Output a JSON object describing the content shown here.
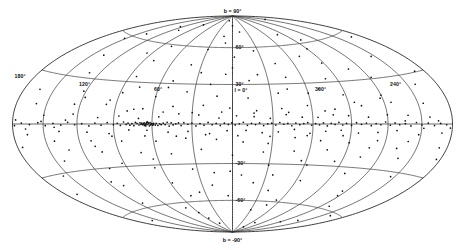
{
  "figure": {
    "name": "galactic-sky-map",
    "projection": "Hammer-Aitoff",
    "coordinate_system": "galactic",
    "background_color": "#ffffff",
    "line_color": "#3a3a3a",
    "point_color": "#111111"
  },
  "labels": {
    "north_pole": "b = 90°",
    "south_pole": "b = -90°",
    "center_longitude": "l = 0°",
    "longitude_ticks": [
      {
        "text": "180°",
        "lon": 180
      },
      {
        "text": "120°",
        "lon": 120
      },
      {
        "text": "60°",
        "lon": 60
      },
      {
        "text": "300°",
        "lon": -60
      },
      {
        "text": "240°",
        "lon": -120
      }
    ],
    "latitude_ticks": [
      {
        "text": "60°",
        "lat": 60
      },
      {
        "text": "30°",
        "lat": 30
      },
      {
        "text": "-30°",
        "lat": -30
      },
      {
        "text": "-60°",
        "lat": -60
      }
    ]
  },
  "chart_data": {
    "type": "scatter",
    "title": "",
    "xlabel": "Galactic longitude l",
    "ylabel": "Galactic latitude b",
    "projection": "Hammer-Aitoff equal-area",
    "grid": true,
    "legend": null,
    "xlim": [
      180,
      -180
    ],
    "ylim": [
      -90,
      90
    ],
    "graticule": {
      "longitude_lines": [
        180,
        150,
        120,
        90,
        60,
        30,
        0,
        -30,
        -60,
        -90,
        -120,
        -150,
        -180
      ],
      "latitude_lines": [
        60,
        30,
        0,
        -30,
        -60
      ],
      "labeled_longitudes": [
        180,
        120,
        60,
        0,
        -60,
        -120
      ],
      "labeled_latitudes": [
        90,
        60,
        30,
        -30,
        -60,
        -90
      ]
    },
    "point_count": 312,
    "point_radius_px": 0.85,
    "points": [
      [
        62.5,
        0.2
      ],
      [
        63.8,
        -0.4
      ],
      [
        64.5,
        0.5
      ],
      [
        65.2,
        -0.2
      ],
      [
        66.0,
        0.8
      ],
      [
        61.0,
        -0.6
      ],
      [
        60.2,
        0.3
      ],
      [
        59.5,
        -0.9
      ],
      [
        64.0,
        1.2
      ],
      [
        65.8,
        -1.0
      ],
      [
        63.0,
        0.9
      ],
      [
        62.0,
        -1.3
      ],
      [
        66.5,
        0.1
      ],
      [
        67.2,
        -0.5
      ],
      [
        61.5,
        1.0
      ],
      [
        58.8,
        0.4
      ],
      [
        60.8,
        -0.1
      ],
      [
        64.8,
        -1.4
      ],
      [
        63.5,
        1.5
      ],
      [
        59.0,
        -0.3
      ],
      [
        67.8,
        0.6
      ],
      [
        57.5,
        -0.8
      ],
      [
        68.5,
        -0.2
      ],
      [
        56.8,
        0.5
      ],
      [
        69.2,
        0.9
      ],
      [
        55.5,
        -1.1
      ],
      [
        70.0,
        -0.7
      ],
      [
        54.2,
        0.2
      ],
      [
        71.5,
        0.4
      ],
      [
        53.0,
        -0.5
      ],
      [
        72.8,
        1.1
      ],
      [
        51.5,
        0.7
      ],
      [
        74.0,
        -1.2
      ],
      [
        50.0,
        -0.4
      ],
      [
        75.5,
        0.3
      ],
      [
        48.5,
        1.3
      ],
      [
        77.0,
        -0.8
      ],
      [
        47.0,
        -1.5
      ],
      [
        78.5,
        0.6
      ],
      [
        45.5,
        0.9
      ],
      [
        80.0,
        -0.3
      ],
      [
        44.0,
        -0.7
      ],
      [
        82.0,
        1.4
      ],
      [
        42.0,
        0.1
      ],
      [
        84.5,
        -1.0
      ],
      [
        40.0,
        0.8
      ],
      [
        87.0,
        0.5
      ],
      [
        38.0,
        -1.2
      ],
      [
        90.0,
        -0.6
      ],
      [
        36.0,
        1.0
      ],
      [
        33.0,
        -0.2
      ],
      [
        30.0,
        0.7
      ],
      [
        27.0,
        -1.4
      ],
      [
        24.0,
        0.3
      ],
      [
        21.0,
        -0.9
      ],
      [
        18.0,
        1.2
      ],
      [
        15.0,
        -0.5
      ],
      [
        12.0,
        0.4
      ],
      [
        9.0,
        -1.1
      ],
      [
        6.0,
        0.6
      ],
      [
        3.0,
        -0.3
      ],
      [
        0.5,
        0.9
      ],
      [
        -2.0,
        -0.7
      ],
      [
        -5.0,
        0.2
      ],
      [
        -8.0,
        1.3
      ],
      [
        -11.0,
        -1.0
      ],
      [
        -14.0,
        0.5
      ],
      [
        -17.0,
        -0.4
      ],
      [
        -20.0,
        0.8
      ],
      [
        -23.0,
        -1.2
      ],
      [
        -26.0,
        0.1
      ],
      [
        -29.0,
        0.6
      ],
      [
        -32.0,
        -0.8
      ],
      [
        -35.0,
        1.1
      ],
      [
        -38.0,
        -0.2
      ],
      [
        -41.0,
        0.4
      ],
      [
        -44.0,
        -1.3
      ],
      [
        -47.0,
        0.7
      ],
      [
        -50.0,
        -0.5
      ],
      [
        -53.0,
        0.3
      ],
      [
        -56.0,
        1.0
      ],
      [
        -59.0,
        -0.9
      ],
      [
        -62.0,
        0.2
      ],
      [
        -65.0,
        -0.6
      ],
      [
        -68.0,
        0.8
      ],
      [
        -71.0,
        -1.4
      ],
      [
        -74.0,
        0.5
      ],
      [
        -77.0,
        -0.3
      ],
      [
        -80.0,
        1.2
      ],
      [
        -83.0,
        -0.7
      ],
      [
        -86.0,
        0.4
      ],
      [
        -90.0,
        -1.0
      ],
      [
        -94.0,
        0.9
      ],
      [
        -98.0,
        -0.2
      ],
      [
        -102.0,
        0.6
      ],
      [
        -106.0,
        -1.1
      ],
      [
        -110.0,
        0.3
      ],
      [
        -114.0,
        -0.5
      ],
      [
        -118.0,
        1.3
      ],
      [
        -122.0,
        -0.8
      ],
      [
        -126.0,
        0.7
      ],
      [
        -130.0,
        -0.4
      ],
      [
        -135.0,
        0.2
      ],
      [
        -140.0,
        -1.2
      ],
      [
        -145.0,
        0.9
      ],
      [
        -150.0,
        -0.6
      ],
      [
        -156.0,
        0.5
      ],
      [
        -162.0,
        -0.9
      ],
      [
        -168.0,
        0.3
      ],
      [
        -174.0,
        -0.4
      ],
      [
        95.0,
        1.0
      ],
      [
        100.0,
        -0.8
      ],
      [
        105.0,
        0.6
      ],
      [
        110.0,
        -1.3
      ],
      [
        116.0,
        0.2
      ],
      [
        122.0,
        -0.5
      ],
      [
        128.0,
        1.1
      ],
      [
        134.0,
        -0.7
      ],
      [
        141.0,
        0.4
      ],
      [
        148.0,
        -1.0
      ],
      [
        155.0,
        0.8
      ],
      [
        163.0,
        -0.3
      ],
      [
        171.0,
        0.5
      ],
      [
        178.0,
        -0.9
      ],
      [
        70.5,
        4.0
      ],
      [
        64.0,
        -4.5
      ],
      [
        55.0,
        5.2
      ],
      [
        48.0,
        -6.0
      ],
      [
        40.0,
        7.5
      ],
      [
        33.0,
        -5.5
      ],
      [
        25.0,
        6.8
      ],
      [
        17.0,
        -7.2
      ],
      [
        10.0,
        4.5
      ],
      [
        4.0,
        -5.0
      ],
      [
        -3.0,
        6.2
      ],
      [
        -10.0,
        -4.8
      ],
      [
        -16.0,
        5.5
      ],
      [
        -22.0,
        -6.5
      ],
      [
        -28.0,
        4.2
      ],
      [
        -34.0,
        -5.8
      ],
      [
        -40.0,
        7.0
      ],
      [
        -46.0,
        -4.0
      ],
      [
        -52.0,
        5.0
      ],
      [
        -58.0,
        -6.8
      ],
      [
        -64.0,
        4.8
      ],
      [
        -70.0,
        -5.2
      ],
      [
        -76.0,
        6.5
      ],
      [
        -82.0,
        -4.4
      ],
      [
        -88.0,
        5.8
      ],
      [
        -96.0,
        -6.2
      ],
      [
        -104.0,
        4.6
      ],
      [
        -112.0,
        -5.6
      ],
      [
        -120.0,
        6.0
      ],
      [
        -128.0,
        -4.2
      ],
      [
        -138.0,
        5.4
      ],
      [
        -148.0,
        -6.4
      ],
      [
        -158.0,
        4.0
      ],
      [
        -170.0,
        -5.0
      ],
      [
        78.0,
        -4.2
      ],
      [
        86.0,
        5.6
      ],
      [
        94.0,
        -6.6
      ],
      [
        103.0,
        4.4
      ],
      [
        112.0,
        -5.4
      ],
      [
        124.0,
        6.4
      ],
      [
        136.0,
        -4.6
      ],
      [
        150.0,
        5.2
      ],
      [
        166.0,
        -6.0
      ],
      [
        68.0,
        11.0
      ],
      [
        58.0,
        -12.5
      ],
      [
        45.0,
        13.0
      ],
      [
        35.0,
        -10.5
      ],
      [
        22.0,
        14.0
      ],
      [
        12.0,
        -11.5
      ],
      [
        2.0,
        12.0
      ],
      [
        -8.0,
        -13.5
      ],
      [
        -18.0,
        10.0
      ],
      [
        -27.0,
        -14.5
      ],
      [
        -37.0,
        11.5
      ],
      [
        -47.0,
        -10.0
      ],
      [
        -57.0,
        13.5
      ],
      [
        -67.0,
        -12.0
      ],
      [
        -78.0,
        10.5
      ],
      [
        -90.0,
        -13.0
      ],
      [
        -100.0,
        12.5
      ],
      [
        -113.0,
        -11.0
      ],
      [
        -126.0,
        14.0
      ],
      [
        -140.0,
        -10.8
      ],
      [
        -155.0,
        12.2
      ],
      [
        -172.0,
        -13.2
      ],
      [
        75.0,
        10.5
      ],
      [
        85.0,
        -12.0
      ],
      [
        98.0,
        13.5
      ],
      [
        110.0,
        -11.2
      ],
      [
        125.0,
        12.8
      ],
      [
        142.0,
        -10.5
      ],
      [
        160.0,
        11.8
      ],
      [
        175.0,
        -12.8
      ],
      [
        60.0,
        20.0
      ],
      [
        48.0,
        -22.0
      ],
      [
        36.0,
        24.0
      ],
      [
        24.0,
        -19.0
      ],
      [
        12.0,
        21.0
      ],
      [
        0.0,
        -23.5
      ],
      [
        -12.0,
        19.5
      ],
      [
        -24.0,
        -21.0
      ],
      [
        -36.0,
        23.0
      ],
      [
        -48.0,
        -20.0
      ],
      [
        -60.0,
        22.5
      ],
      [
        -74.0,
        -18.5
      ],
      [
        -88.0,
        20.5
      ],
      [
        -104.0,
        -22.5
      ],
      [
        -120.0,
        19.0
      ],
      [
        -138.0,
        -21.5
      ],
      [
        -158.0,
        23.5
      ],
      [
        -176.0,
        -19.5
      ],
      [
        72.0,
        -20.5
      ],
      [
        88.0,
        22.0
      ],
      [
        104.0,
        -19.0
      ],
      [
        122.0,
        21.5
      ],
      [
        142.0,
        -23.0
      ],
      [
        164.0,
        20.0
      ],
      [
        50.0,
        32.0
      ],
      [
        34.0,
        -34.0
      ],
      [
        18.0,
        30.0
      ],
      [
        2.0,
        -36.0
      ],
      [
        -14.0,
        33.0
      ],
      [
        -30.0,
        -31.0
      ],
      [
        -46.0,
        35.0
      ],
      [
        -62.0,
        -30.0
      ],
      [
        -80.0,
        32.5
      ],
      [
        -100.0,
        -34.5
      ],
      [
        -122.0,
        31.0
      ],
      [
        -146.0,
        -33.0
      ],
      [
        -170.0,
        30.5
      ],
      [
        66.0,
        -32.0
      ],
      [
        84.0,
        34.0
      ],
      [
        106.0,
        -30.5
      ],
      [
        130.0,
        33.5
      ],
      [
        156.0,
        -31.5
      ],
      [
        40.0,
        45.0
      ],
      [
        20.0,
        -47.0
      ],
      [
        0.0,
        43.0
      ],
      [
        -20.0,
        -45.0
      ],
      [
        -42.0,
        46.0
      ],
      [
        -64.0,
        -42.0
      ],
      [
        -88.0,
        44.0
      ],
      [
        -116.0,
        -46.5
      ],
      [
        -146.0,
        43.5
      ],
      [
        58.0,
        -44.0
      ],
      [
        80.0,
        46.5
      ],
      [
        108.0,
        -43.0
      ],
      [
        138.0,
        45.5
      ],
      [
        168.0,
        -42.5
      ],
      [
        30.0,
        58.0
      ],
      [
        5.0,
        -56.0
      ],
      [
        -25.0,
        57.0
      ],
      [
        -55.0,
        -58.5
      ],
      [
        -90.0,
        55.5
      ],
      [
        -130.0,
        -57.5
      ],
      [
        -168.0,
        56.0
      ],
      [
        48.0,
        -55.0
      ],
      [
        78.0,
        58.5
      ],
      [
        115.0,
        -56.5
      ],
      [
        152.0,
        57.5
      ],
      [
        15.0,
        70.0
      ],
      [
        -30.0,
        -68.0
      ],
      [
        -80.0,
        69.0
      ],
      [
        -140.0,
        -70.5
      ],
      [
        60.0,
        -69.5
      ],
      [
        110.0,
        71.0
      ],
      [
        160.0,
        -67.5
      ],
      [
        0.0,
        80.0
      ],
      [
        -70.0,
        -79.0
      ],
      [
        90.0,
        78.5
      ],
      [
        -150.0,
        81.0
      ],
      [
        45.0,
        -80.5
      ],
      [
        130.0,
        2.5
      ],
      [
        140.0,
        -2.0
      ],
      [
        152.0,
        1.5
      ],
      [
        167.0,
        -2.8
      ],
      [
        177.0,
        2.2
      ],
      [
        -135.0,
        2.0
      ],
      [
        -152.0,
        -2.5
      ],
      [
        -166.0,
        1.8
      ],
      [
        -178.0,
        -2.2
      ],
      [
        30.0,
        8.5
      ],
      [
        20.0,
        -8.0
      ],
      [
        8.0,
        9.0
      ],
      [
        -4.0,
        -8.8
      ],
      [
        -16.0,
        8.2
      ],
      [
        -28.0,
        -9.2
      ],
      [
        -42.0,
        8.6
      ],
      [
        -56.0,
        -8.4
      ],
      [
        -70.0,
        9.4
      ],
      [
        -84.0,
        -8.2
      ],
      [
        42.0,
        -9.0
      ],
      [
        52.0,
        8.8
      ],
      [
        66.0,
        -8.6
      ],
      [
        80.0,
        9.2
      ],
      [
        92.0,
        -8.4
      ],
      [
        -95.0,
        15.0
      ],
      [
        -108.0,
        -16.0
      ],
      [
        -118.0,
        17.0
      ],
      [
        -132.0,
        -15.5
      ],
      [
        96.0,
        16.5
      ],
      [
        108.0,
        -15.0
      ],
      [
        118.0,
        17.5
      ],
      [
        132.0,
        -16.5
      ],
      [
        -44.0,
        26.0
      ],
      [
        -56.0,
        -27.0
      ],
      [
        -70.0,
        25.5
      ],
      [
        -84.0,
        -26.5
      ],
      [
        52.0,
        27.0
      ],
      [
        64.0,
        -25.5
      ],
      [
        76.0,
        26.5
      ],
      [
        92.0,
        -27.5
      ],
      [
        6.0,
        38.0
      ],
      [
        -8.0,
        -39.0
      ],
      [
        -22.0,
        37.5
      ],
      [
        -36.0,
        -38.5
      ],
      [
        16.0,
        -37.0
      ],
      [
        28.0,
        39.0
      ],
      [
        -108.0,
        38.0
      ],
      [
        116.0,
        -39.5
      ],
      [
        -2.0,
        52.0
      ],
      [
        -38.0,
        -51.0
      ],
      [
        -72.0,
        50.5
      ],
      [
        36.0,
        -52.5
      ],
      [
        96.0,
        51.5
      ],
      [
        -118.0,
        -50.0
      ],
      [
        10.0,
        64.0
      ],
      [
        -48.0,
        -63.0
      ],
      [
        -100.0,
        62.5
      ],
      [
        70.0,
        -64.5
      ],
      [
        140.0,
        63.5
      ],
      [
        -160.0,
        -62.0
      ],
      [
        -15.0,
        74.0
      ],
      [
        55.0,
        -75.0
      ],
      [
        125.0,
        73.5
      ],
      [
        -120.0,
        -74.5
      ],
      [
        20.0,
        85.0
      ],
      [
        -60.0,
        -84.0
      ]
    ]
  }
}
